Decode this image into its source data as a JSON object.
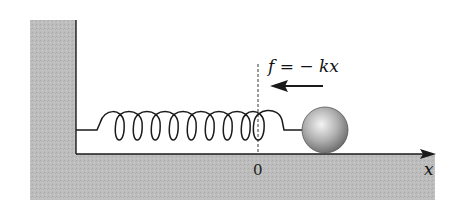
{
  "diagram": {
    "force_label": "f = − kx",
    "origin_label": "0",
    "axis_label": "x",
    "spring_loops": 8,
    "colors": {
      "ground": "#b8b8b8",
      "line": "#1a1a1a",
      "ball_light": "#f2f2f2",
      "ball_dark": "#6e6e6e"
    }
  }
}
